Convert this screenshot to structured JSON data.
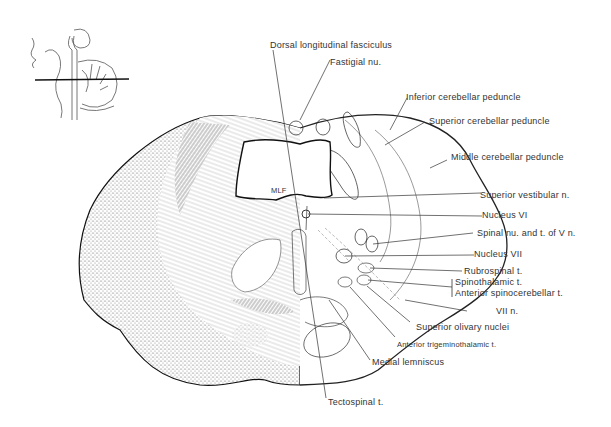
{
  "figure": {
    "type": "anatomical cross-section diagram",
    "inset": {
      "description": "Sagittal orientation sketch of brainstem and cerebellum with horizontal cut line"
    },
    "labels": {
      "dorsal_longitudinal_fasciculus": "Dorsal longitudinal fasciculus",
      "fastigial_nu": "Fastigial nu.",
      "inferior_cerebellar_peduncle": "Inferior cerebellar peduncle",
      "superior_cerebellar_peduncle": "Superior cerebellar peduncle",
      "middle_cerebellar_peduncle": "Middle cerebellar peduncle",
      "mlf": "MLF",
      "superior_vestibular_n": "Superior vestibular n.",
      "nucleus_vi": "Nucleus VI",
      "spinal_nu_v": "Spinal nu. and t. of V n.",
      "nucleus_vii": "Nucleus VII",
      "rubrospinal_t": "Rubrospinal t.",
      "spinothalamic_t": "Spinothalamic t.",
      "anterior_spinocerebellar_t": "Anterior spinocerebellar t.",
      "vii_n": "VII n.",
      "superior_olivary_nuclei": "Superior olivary nuclei",
      "anterior_trigeminothalamic_t": "Anterior trigeminothalamic t.",
      "medial_lemniscus": "Medial lemniscus",
      "tectospinal_t": "Tectospinal t."
    }
  }
}
